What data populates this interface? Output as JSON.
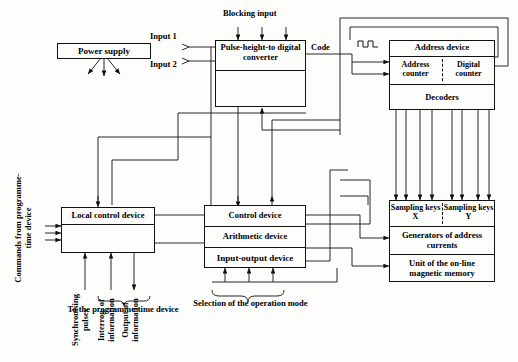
{
  "diagram": {
    "ink_color": "#111111",
    "background_color": "#fdfdfb"
  },
  "blocks": {
    "power_supply": {
      "label": "Power supply"
    },
    "pulse_height_converter": {
      "label": "Pulse-height-to digital converter"
    },
    "address_device": {
      "title": "Address device",
      "address_counter": "Address counter",
      "digital_counter": "Digital counter",
      "decoders": "Decoders"
    },
    "local_control_device": {
      "label": "Local control device"
    },
    "computer": {
      "control_device": "Control device",
      "arithmetic_device": "Arithmetic device",
      "input_output_device": "Input-output device"
    },
    "memory": {
      "sampling_keys_x": "Sampling keys X",
      "sampling_keys_y": "Sampling keys Y",
      "generators": "Generators of address currents",
      "memory_unit": "Unit of the on-line magnetic memory"
    }
  },
  "labels": {
    "blocking_input": "Blocking input",
    "input_1": "Input 1",
    "input_2": "Input 2",
    "code": "Code",
    "commands_from": "Commands from programme-time device",
    "synchronising_pulses": "Synchronising pulses",
    "interrogation": "Interrog. of information",
    "output_of_information": "Output of information",
    "to_programme_time_device": "To the programme-time device",
    "selection_of_mode": "Selection of the operation mode"
  },
  "icons": {
    "pulse_waveform": "pulse-waveform-icon",
    "brace_bottom_left": "curly-brace-icon",
    "brace_bottom_center": "curly-brace-icon"
  }
}
